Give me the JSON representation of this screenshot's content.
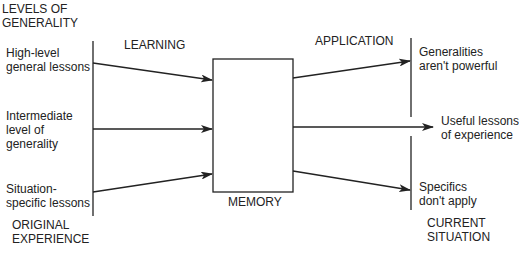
{
  "diagram": {
    "colors": {
      "line": "#222222",
      "background": "#ffffff"
    },
    "headers": {
      "levels": [
        "LEVELS OF",
        "GENERALITY"
      ],
      "learning": "LEARNING",
      "application": "APPLICATION",
      "memory": "MEMORY",
      "original": [
        "ORIGINAL",
        "EXPERIENCE"
      ],
      "current": [
        "CURRENT",
        "SITUATION"
      ]
    },
    "left_levels": [
      {
        "lines": [
          "High-level",
          "general lessons"
        ]
      },
      {
        "lines": [
          "Intermediate",
          "level of",
          "generality"
        ]
      },
      {
        "lines": [
          "Situation-",
          "specific lessons"
        ]
      }
    ],
    "right_outcomes": [
      {
        "lines": [
          "Generalities",
          "aren't powerful"
        ]
      },
      {
        "lines": [
          "Useful lessons",
          "of experience"
        ]
      },
      {
        "lines": [
          "Specifics",
          "don't apply"
        ]
      }
    ]
  }
}
